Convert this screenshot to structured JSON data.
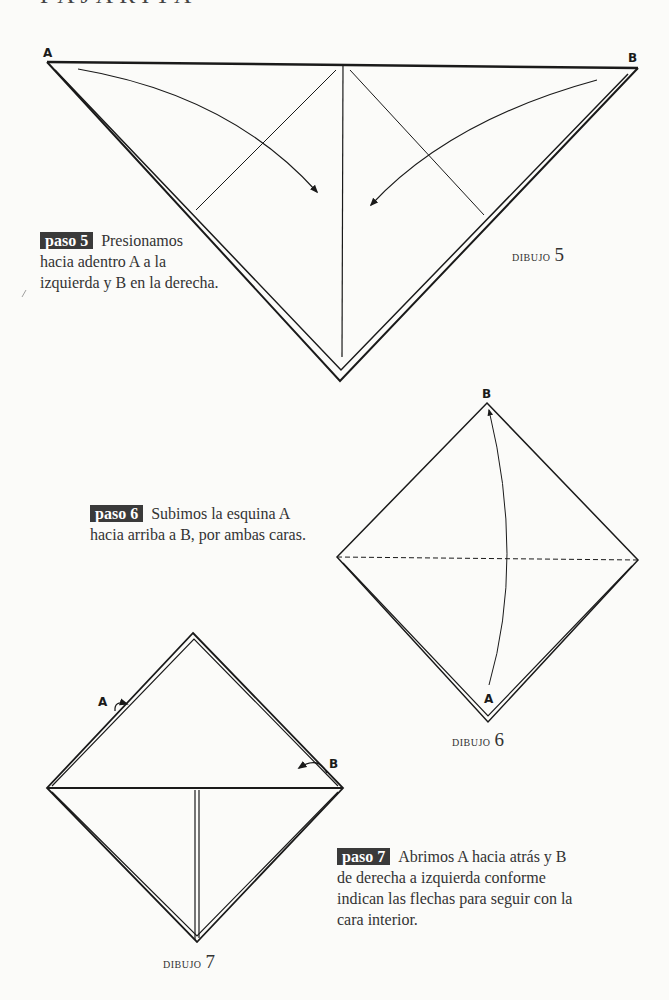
{
  "page": {
    "heading_partial": "PAJARITA"
  },
  "steps": [
    {
      "badge": "paso 5",
      "text": "Presionamos hacia adentro A a la izquierda y B en la derecha.",
      "lines": [
        "Presionamos",
        "hacia adentro A a la",
        "izquierda y B en la derecha."
      ]
    },
    {
      "badge": "paso 6",
      "text": "Subimos la esquina A hacia arriba a B, por ambas caras.",
      "lines": [
        "Subimos la esquina A",
        "hacia arriba a B, por ambas caras."
      ]
    },
    {
      "badge": "paso 7",
      "text": "Abrimos A hacia atrás y B de derecha a izquierda conforme indican las flechas para seguir con la cara interior.",
      "lines": [
        "Abrimos A hacia atrás y B",
        "de derecha a izquierda conforme",
        "indican las flechas para seguir con la",
        "cara interior."
      ]
    }
  ],
  "drawings": [
    {
      "caption_word": "dibujo",
      "caption_num": "5",
      "labels": [
        "A",
        "B"
      ]
    },
    {
      "caption_word": "dibujo",
      "caption_num": "6",
      "labels": [
        "B",
        "A"
      ]
    },
    {
      "caption_word": "dibujo",
      "caption_num": "7",
      "labels": [
        "A",
        "B"
      ]
    }
  ],
  "colors": {
    "background": "#fbfbf9",
    "ink": "#1a1a1a",
    "badge_bg": "#3a3a3a",
    "badge_text": "#ffffff"
  }
}
